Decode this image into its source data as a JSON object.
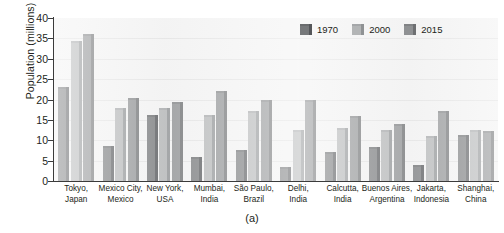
{
  "chart_data": {
    "type": "bar",
    "title": "",
    "subtitle": "",
    "xlabel": "",
    "ylabel": "Population (millions)",
    "ylim": [
      0,
      40
    ],
    "ytick_step": 5,
    "yticks": [
      "40",
      "35",
      "30",
      "25",
      "20",
      "15",
      "10",
      "5",
      "0"
    ],
    "grid": true,
    "grid_axis": "y",
    "legend_position": "top-right",
    "categories": [
      "Tokyo, Japan",
      "Mexico City, Mexico",
      "New York, USA",
      "Mumbai, India",
      "São Paulo, Brazil",
      "Delhi, India",
      "Calcutta, India",
      "Buenos Aires, Argentina",
      "Jakarta, Indonesia",
      "Shanghai, China"
    ],
    "categories_lines": [
      [
        "Tokyo,",
        "Japan"
      ],
      [
        "Mexico City,",
        "Mexico"
      ],
      [
        "New York,",
        "USA"
      ],
      [
        "Mumbai,",
        "India"
      ],
      [
        "São Paulo,",
        "Brazil"
      ],
      [
        "Delhi,",
        "India"
      ],
      [
        "Calcutta,",
        "India"
      ],
      [
        "Buenos Aires,",
        "Argentina"
      ],
      [
        "Jakarta,",
        "Indonesia"
      ],
      [
        "Shanghai,",
        "China"
      ]
    ],
    "series": [
      {
        "name": "1970",
        "color": "#77797b",
        "values": [
          23.0,
          8.7,
          16.2,
          5.9,
          7.6,
          3.5,
          7.1,
          8.4,
          3.9,
          11.2
        ]
      },
      {
        "name": "2000",
        "color": "#b3b5b6",
        "values": [
          34.4,
          18.0,
          17.9,
          16.1,
          17.1,
          12.4,
          13.1,
          12.6,
          11.0,
          12.4
        ]
      },
      {
        "name": "2015",
        "color": "#8f9193",
        "values": [
          36.2,
          20.4,
          19.4,
          22.2,
          20.0,
          20.0,
          16.0,
          13.9,
          17.3,
          12.2
        ]
      }
    ]
  },
  "caption": {
    "label": "(a)"
  }
}
